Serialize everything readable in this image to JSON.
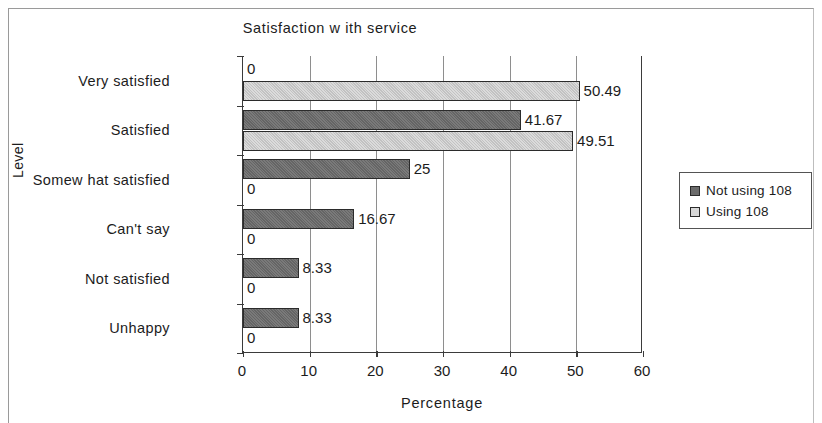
{
  "chart_data": {
    "type": "bar",
    "orientation": "horizontal",
    "title": "Satisfaction w ith service",
    "xlabel": "Percentage",
    "ylabel": "Level",
    "xlim": [
      0,
      60
    ],
    "xticks": [
      "0",
      "10",
      "20",
      "30",
      "40",
      "50",
      "60"
    ],
    "grid": true,
    "legend_position": "right",
    "categories": [
      "Very satisfied",
      "Satisfied",
      "Somew hat satisfied",
      "Can't say",
      "Not satisfied",
      "Unhappy"
    ],
    "series": [
      {
        "name": "Not using 108",
        "color": "#6b6b6b",
        "values": [
          0,
          41.67,
          25,
          16.67,
          8.33,
          8.33
        ],
        "labels": [
          "0",
          "41.67",
          "25",
          "16.67",
          "8.33",
          "8.33"
        ]
      },
      {
        "name": "Using 108",
        "color": "#cccccc",
        "values": [
          50.49,
          49.51,
          0,
          0,
          0,
          0
        ],
        "labels": [
          "50.49",
          "49.51",
          "0",
          "0",
          "0",
          "0"
        ]
      }
    ]
  },
  "legend": {
    "items": [
      {
        "label": "Not using 108"
      },
      {
        "label": "Using 108"
      }
    ]
  }
}
